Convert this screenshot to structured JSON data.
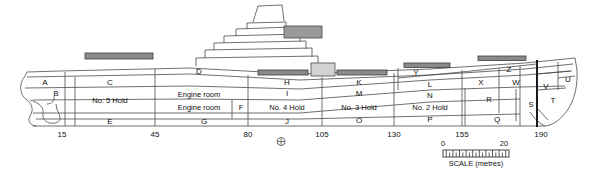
{
  "diagram": {
    "colors": {
      "line": "#4a4a4a",
      "hatch_dark": "#7d7d7d",
      "deckhouse_grey": "#cfcfcf",
      "text": "#111111"
    }
  },
  "deck_compartments": [
    {
      "label": "A",
      "x": 45,
      "y": 83
    },
    {
      "label": "C",
      "x": 110,
      "y": 83
    },
    {
      "label": "D",
      "x": 199,
      "y": 72
    },
    {
      "label": "H",
      "x": 287,
      "y": 83
    },
    {
      "label": "K",
      "x": 359,
      "y": 83
    },
    {
      "label": "Y",
      "x": 416,
      "y": 73
    },
    {
      "label": "L",
      "x": 430,
      "y": 85
    },
    {
      "label": "Z",
      "x": 509,
      "y": 70
    },
    {
      "label": "X",
      "x": 481,
      "y": 83
    },
    {
      "label": "W",
      "x": 516,
      "y": 83
    },
    {
      "label": "V",
      "x": 546,
      "y": 87
    },
    {
      "label": "U",
      "x": 568,
      "y": 80
    }
  ],
  "second_deck_compartments": [
    {
      "label": "B",
      "x": 56,
      "y": 94
    },
    {
      "label": "I",
      "x": 287,
      "y": 94
    },
    {
      "label": "M",
      "x": 359,
      "y": 94
    },
    {
      "label": "N",
      "x": 430,
      "y": 96
    },
    {
      "label": "T",
      "x": 553,
      "y": 101
    }
  ],
  "hold_compartments": [
    {
      "label": "No. 5 Hold",
      "x": 110,
      "y": 101
    },
    {
      "label": "Engine room",
      "x": 199,
      "y": 95
    },
    {
      "label": "Engine room",
      "x": 199,
      "y": 108
    },
    {
      "label": "F",
      "x": 241,
      "y": 108
    },
    {
      "label": "No. 4 Hold",
      "x": 287,
      "y": 108
    },
    {
      "label": "No. 3 Hold",
      "x": 359,
      "y": 108
    },
    {
      "label": "No. 2 Hold",
      "x": 430,
      "y": 108
    },
    {
      "label": "R",
      "x": 489,
      "y": 100
    },
    {
      "label": "S",
      "x": 531,
      "y": 105
    }
  ],
  "tanktop_compartments": [
    {
      "label": "E",
      "x": 110,
      "y": 122
    },
    {
      "label": "G",
      "x": 204,
      "y": 122
    },
    {
      "label": "J",
      "x": 287,
      "y": 122
    },
    {
      "label": "O",
      "x": 359,
      "y": 121
    },
    {
      "label": "P",
      "x": 430,
      "y": 120
    },
    {
      "label": "Q",
      "x": 497,
      "y": 120
    }
  ],
  "axis": {
    "ticks": [
      {
        "value": "15",
        "x": 62
      },
      {
        "value": "45",
        "x": 155
      },
      {
        "value": "80",
        "x": 248
      },
      {
        "value": "105",
        "x": 322
      },
      {
        "value": "130",
        "x": 394
      },
      {
        "value": "155",
        "x": 462
      },
      {
        "value": "190",
        "x": 541
      }
    ],
    "y": 131,
    "midship_marker": {
      "symbol": "⨁",
      "x": 281,
      "y": 141
    }
  },
  "scalebar": {
    "start_label": "0",
    "end_label": "20",
    "caption": "SCALE (metres)",
    "left": 443,
    "right": 509,
    "y": 158
  }
}
